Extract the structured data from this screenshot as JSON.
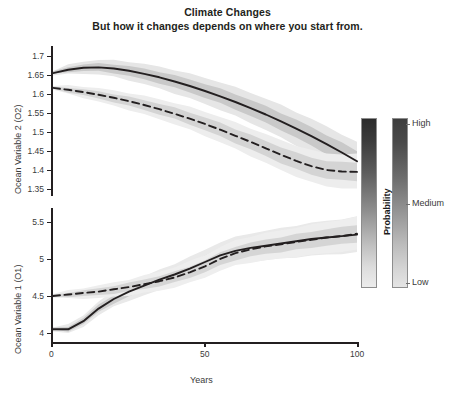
{
  "title": {
    "main": "Climate Changes",
    "sub": "But how it changes depends on where you start from."
  },
  "legend": {
    "axis_label": "Probability",
    "ticks": [
      "High",
      "Medium",
      "Low"
    ],
    "bar_count": 2,
    "colors": {
      "high": "#2b2b2b",
      "medium": "#8f8f8f",
      "low": "#ececec"
    }
  },
  "chart_data": {
    "type": "line",
    "title": "Climate Changes",
    "subtitle": "But how it changes depends on where you start from.",
    "xlabel": "Years",
    "grid": false,
    "legend_position": "right",
    "panels": [
      {
        "id": "panel-o2",
        "ylabel": "Ocean Variable 2 (O2)",
        "ylim": [
          1.33,
          1.72
        ],
        "yticks": [
          1.7,
          1.65,
          1.6,
          1.55,
          1.5,
          1.45,
          1.4,
          1.35
        ],
        "xlim": [
          0,
          100
        ],
        "xticks": [
          0,
          50,
          100
        ],
        "series": [
          {
            "name": "high-start-solid",
            "style": "solid",
            "color": "#231f20",
            "x": [
              0,
              5,
              10,
              15,
              20,
              25,
              30,
              35,
              40,
              45,
              50,
              55,
              60,
              65,
              70,
              75,
              80,
              85,
              90,
              95,
              100
            ],
            "values": [
              1.655,
              1.664,
              1.669,
              1.67,
              1.667,
              1.661,
              1.653,
              1.644,
              1.633,
              1.621,
              1.608,
              1.594,
              1.579,
              1.563,
              1.546,
              1.528,
              1.509,
              1.489,
              1.468,
              1.446,
              1.423
            ],
            "band_outer": {
              "name": "low probability",
              "color": "#e6e6e6"
            },
            "band_inner": {
              "name": "high probability",
              "color": "#c9c9c9"
            }
          },
          {
            "name": "low-start-dashed",
            "style": "dashed",
            "color": "#231f20",
            "x": [
              0,
              5,
              10,
              15,
              20,
              25,
              30,
              35,
              40,
              45,
              50,
              55,
              60,
              65,
              70,
              75,
              80,
              85,
              90,
              95,
              100
            ],
            "values": [
              1.616,
              1.611,
              1.605,
              1.598,
              1.59,
              1.581,
              1.571,
              1.56,
              1.548,
              1.535,
              1.521,
              1.506,
              1.49,
              1.474,
              1.457,
              1.44,
              1.424,
              1.41,
              1.4,
              1.396,
              1.395
            ],
            "band_outer": {
              "name": "low probability",
              "color": "#ededed"
            },
            "band_inner": {
              "name": "high probability",
              "color": "#d4d4d4"
            }
          }
        ]
      },
      {
        "id": "panel-o1",
        "ylabel": "Ocean Variable 1 (O1)",
        "ylim": [
          3.82,
          5.72
        ],
        "yticks": [
          5.5,
          5.0,
          4.5,
          4.0
        ],
        "xlim": [
          0,
          100
        ],
        "xticks": [
          0,
          50,
          100
        ],
        "series": [
          {
            "name": "low-start-solid",
            "style": "solid",
            "color": "#231f20",
            "x": [
              0,
              5,
              10,
              15,
              20,
              25,
              30,
              35,
              40,
              45,
              50,
              55,
              60,
              65,
              70,
              75,
              80,
              85,
              90,
              95,
              100
            ],
            "values": [
              4.05,
              4.05,
              4.16,
              4.33,
              4.46,
              4.56,
              4.64,
              4.72,
              4.79,
              4.87,
              4.96,
              5.05,
              5.11,
              5.15,
              5.18,
              5.21,
              5.24,
              5.27,
              5.29,
              5.31,
              5.33
            ],
            "band_outer": {
              "name": "low probability",
              "color": "#e9e9e9"
            },
            "band_inner": {
              "name": "high probability",
              "color": "#cccccc"
            }
          },
          {
            "name": "high-start-dashed",
            "style": "dashed",
            "color": "#231f20",
            "x": [
              0,
              5,
              10,
              15,
              20,
              25,
              30,
              35,
              40,
              45,
              50,
              55,
              60,
              65,
              70,
              75,
              80,
              85,
              90,
              95,
              100
            ],
            "values": [
              4.5,
              4.52,
              4.54,
              4.56,
              4.59,
              4.62,
              4.66,
              4.7,
              4.75,
              4.82,
              4.9,
              5.0,
              5.08,
              5.13,
              5.17,
              5.2,
              5.23,
              5.26,
              5.29,
              5.31,
              5.34
            ],
            "band_outer": {
              "name": "low probability",
              "color": "#eeeeee"
            },
            "band_inner": {
              "name": "high probability",
              "color": "#d5d5d5"
            }
          }
        ]
      }
    ]
  }
}
